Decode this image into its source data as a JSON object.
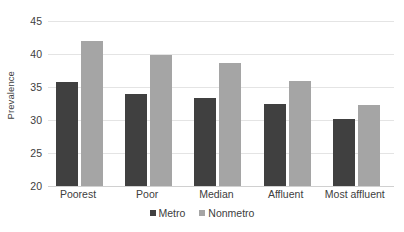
{
  "chart_data": {
    "type": "bar",
    "title": "",
    "xlabel": "",
    "ylabel": "Prevalence",
    "categories": [
      "Poorest",
      "Poor",
      "Median",
      "Affluent",
      "Most affluent"
    ],
    "series": [
      {
        "name": "Metro",
        "color": "#404040",
        "values": [
          35.8,
          34.0,
          33.4,
          32.4,
          30.2
        ]
      },
      {
        "name": "Nonmetro",
        "color": "#a5a5a5",
        "values": [
          42.0,
          39.8,
          38.6,
          35.9,
          32.3
        ]
      }
    ],
    "ylim": [
      20,
      45
    ],
    "yticks": [
      20,
      25,
      30,
      35,
      40,
      45
    ],
    "ytick_labels": [
      "20",
      "25",
      "30",
      "35",
      "40",
      "45"
    ],
    "grid": true,
    "grid_color": "#e4e4e4",
    "legend": true,
    "legend_position": "bottom"
  }
}
